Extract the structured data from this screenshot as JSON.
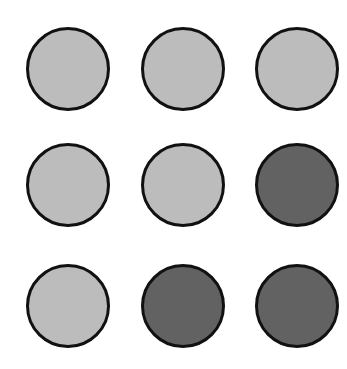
{
  "grid": {
    "rows": 3,
    "cols": 3,
    "colors": {
      "light": "#bcbcbc",
      "dark": "#626262",
      "outline": "#111111"
    },
    "cells": [
      [
        "light",
        "light",
        "light"
      ],
      [
        "light",
        "light",
        "dark"
      ],
      [
        "light",
        "dark",
        "dark"
      ]
    ]
  }
}
